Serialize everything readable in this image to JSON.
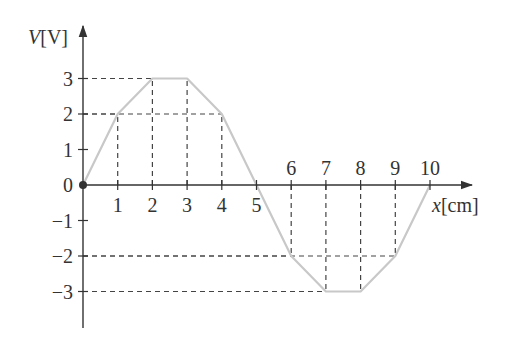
{
  "chart_data": {
    "type": "line",
    "title": "",
    "xlabel": "x[cm]",
    "ylabel": "V[V]",
    "x": [
      0,
      1,
      2,
      3,
      4,
      5,
      6,
      7,
      8,
      9,
      10
    ],
    "series": [
      {
        "name": "V(x)",
        "values": [
          0,
          2,
          3,
          3,
          2,
          0,
          -2,
          -3,
          -3,
          -2,
          0
        ],
        "color": "#c8c8c8"
      }
    ],
    "x_ticks": [
      "1",
      "2",
      "3",
      "4",
      "5",
      "6",
      "7",
      "8",
      "9",
      "10"
    ],
    "y_ticks": [
      "-3",
      "-2",
      "-1",
      "0",
      "1",
      "2",
      "3"
    ],
    "origin_label": "0",
    "xlim": [
      0,
      10
    ],
    "ylim": [
      -3,
      3
    ],
    "grid": false,
    "guide_lines": "dashed projections from each vertex to both axes",
    "legend": "none"
  },
  "colors": {
    "axis": "#333333",
    "curve": "#c8c8c8",
    "dash": "#444444"
  }
}
